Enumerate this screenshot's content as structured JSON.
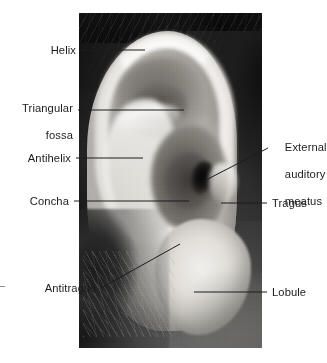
{
  "figure": {
    "photo_name": "ear-photograph",
    "background_color": "#ffffff",
    "text_color": "#1c1c1c",
    "leader_color": "#1c1c1c"
  },
  "labels": {
    "helix": "Helix",
    "triangular_fossa_line1": "Triangular",
    "triangular_fossa_line2": "fossa",
    "antihelix": "Antihelix",
    "concha": "Concha",
    "antitragus": "Antitragus",
    "external_auditory_meatus_line1": "External",
    "external_auditory_meatus_line2": "auditory",
    "external_auditory_meatus_line3": "meatus",
    "tragus": "Tragus",
    "lobule": "Lobule"
  },
  "callouts": [
    {
      "name": "helix",
      "text": "Helix",
      "side": "left",
      "leader": "horizontal"
    },
    {
      "name": "triangular-fossa",
      "text": "Triangular fossa",
      "side": "left",
      "leader": "horizontal"
    },
    {
      "name": "antihelix",
      "text": "Antihelix",
      "side": "left",
      "leader": "horizontal"
    },
    {
      "name": "concha",
      "text": "Concha",
      "side": "left",
      "leader": "horizontal"
    },
    {
      "name": "antitragus",
      "text": "Antitragus",
      "side": "left",
      "leader": "diagonal"
    },
    {
      "name": "external-auditory-meatus",
      "text": "External auditory meatus",
      "side": "right",
      "leader": "diagonal"
    },
    {
      "name": "tragus",
      "text": "Tragus",
      "side": "right",
      "leader": "horizontal"
    },
    {
      "name": "lobule",
      "text": "Lobule",
      "side": "right",
      "leader": "horizontal"
    }
  ]
}
